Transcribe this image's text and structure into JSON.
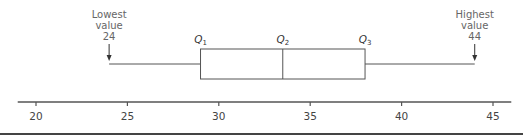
{
  "chart_data": {
    "type": "boxplot",
    "title": "",
    "xlabel": "",
    "ylabel": "",
    "xlim": [
      19,
      46
    ],
    "ticks": [
      20,
      25,
      30,
      35,
      40,
      45
    ],
    "tick_labels": [
      "20",
      "25",
      "30",
      "35",
      "40",
      "45"
    ],
    "grid": false,
    "values": {
      "min": 24,
      "q1": 29,
      "median": 33.5,
      "q3": 38,
      "max": 44
    },
    "annotations": [
      {
        "label_lines": [
          "Lowest",
          "value",
          "24"
        ],
        "x": 24,
        "arrow": true
      },
      {
        "label_lines": [
          "Highest",
          "value",
          "44"
        ],
        "x": 44,
        "arrow": true
      },
      {
        "label": "Q",
        "sub": "1",
        "x": 29
      },
      {
        "label": "Q",
        "sub": "2",
        "x": 33.5
      },
      {
        "label": "Q",
        "sub": "3",
        "x": 38
      }
    ],
    "colors": {
      "box": "#555555",
      "axis": "#555555",
      "label": "#666666"
    }
  }
}
